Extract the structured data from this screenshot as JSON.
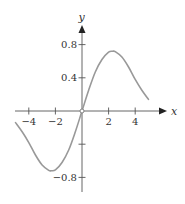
{
  "chart_data": {
    "type": "line",
    "title": "",
    "xlabel": "x",
    "ylabel": "y",
    "xlim": [
      -5,
      5
    ],
    "ylim": [
      -0.8,
      0.8
    ],
    "grid": false,
    "legend": null,
    "x_ticks": [
      -4,
      -2,
      2,
      4
    ],
    "x_tick_labels": [
      "−4",
      "−2",
      "2",
      "4"
    ],
    "y_ticks": [
      -0.8,
      -0.4,
      0.4,
      0.8
    ],
    "y_tick_labels": [
      "−0.8",
      "",
      "0.4",
      "0.8"
    ],
    "series": [
      {
        "name": "f(x)",
        "x": [
          -5,
          -4.5,
          -4,
          -3.5,
          -3,
          -2.5,
          -2.3,
          -2,
          -1.5,
          -1,
          -0.5,
          0,
          0.5,
          1,
          1.5,
          2,
          2.3,
          2.5,
          3,
          3.5,
          4,
          4.5,
          5
        ],
        "y": [
          -0.14,
          -0.25,
          -0.38,
          -0.53,
          -0.65,
          -0.715,
          -0.72,
          -0.71,
          -0.62,
          -0.47,
          -0.25,
          0,
          0.25,
          0.47,
          0.62,
          0.71,
          0.72,
          0.715,
          0.65,
          0.53,
          0.38,
          0.25,
          0.14
        ]
      }
    ],
    "annotations": [
      "open circle at origin"
    ]
  },
  "colors": {
    "axis": "#555555",
    "curve": "#999999",
    "text": "#333333"
  }
}
